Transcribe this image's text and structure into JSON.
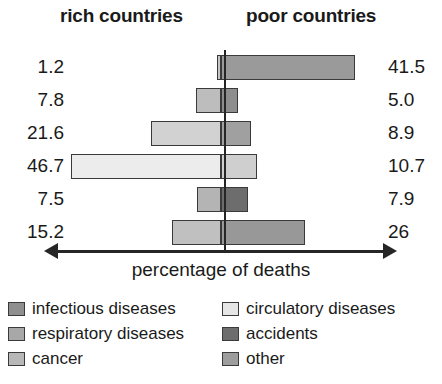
{
  "headings": {
    "left": "rich countries",
    "right": "poor countries"
  },
  "axis": {
    "caption": "percentage of deaths",
    "left_arrow_icon": "arrow-left-icon",
    "right_arrow_icon": "arrow-right-icon"
  },
  "legend": {
    "left_column": [
      {
        "label": "infectious diseases",
        "color": "#8f8f8f"
      },
      {
        "label": "respiratory diseases",
        "color": "#a8a8a8"
      },
      {
        "label": "cancer",
        "color": "#b8b8b8"
      }
    ],
    "right_column": [
      {
        "label": "circulatory diseases",
        "color": "#e6e6e6"
      },
      {
        "label": "accidents",
        "color": "#6d6d6d"
      },
      {
        "label": "other",
        "color": "#9d9d9d"
      }
    ]
  },
  "chart_data": {
    "type": "bar",
    "xlabel": "percentage of deaths",
    "ylabel": "",
    "orientation": "horizontal-diverging",
    "categories": [
      "infectious diseases",
      "respiratory diseases",
      "cancer",
      "circulatory diseases",
      "accidents",
      "other"
    ],
    "series": [
      {
        "name": "rich countries",
        "side": "left",
        "values": [
          1.2,
          7.8,
          21.6,
          46.7,
          7.5,
          15.2
        ],
        "labels": [
          "1.2",
          "7.8",
          "21.6",
          "46.7",
          "7.5",
          "15.2"
        ]
      },
      {
        "name": "poor countries",
        "side": "right",
        "values": [
          41.5,
          5.0,
          8.9,
          10.7,
          7.9,
          26
        ],
        "labels": [
          "41.5",
          "5.0",
          "8.9",
          "10.7",
          "7.9",
          "26"
        ]
      }
    ],
    "colors": [
      "#8f8f8f",
      "#a8a8a8",
      "#b8b8b8",
      "#e6e6e6",
      "#6d6d6d",
      "#9d9d9d"
    ],
    "grid": false,
    "legend_position": "bottom",
    "units": "percent"
  },
  "render": {
    "px_per_unit": 3.22,
    "rows": [
      {
        "category": "infectious diseases",
        "left_width": 4,
        "right_width": 134,
        "left_color": "#c6c6c6",
        "right_color": "#9a9a9a",
        "left_label": "1.2",
        "right_label": "41.5",
        "top": 0
      },
      {
        "category": "respiratory diseases",
        "left_width": 25,
        "right_width": 17,
        "left_color": "#bdbdbd",
        "right_color": "#8e8e8e",
        "left_label": "7.8",
        "right_label": "5.0",
        "top": 33
      },
      {
        "category": "cancer",
        "left_width": 70,
        "right_width": 30,
        "left_color": "#d2d2d2",
        "right_color": "#a0a0a0",
        "left_label": "21.6",
        "right_label": "8.9",
        "top": 66
      },
      {
        "category": "circulatory diseases",
        "left_width": 150,
        "right_width": 36,
        "left_color": "#ececec",
        "right_color": "#cfcfcf",
        "left_label": "46.7",
        "right_label": "10.7",
        "top": 99
      },
      {
        "category": "accidents",
        "left_width": 24,
        "right_width": 27,
        "left_color": "#b4b4b4",
        "right_color": "#6d6d6d",
        "left_label": "7.5",
        "right_label": "7.9",
        "top": 132
      },
      {
        "category": "other",
        "left_width": 49,
        "right_width": 84,
        "left_color": "#c0c0c0",
        "right_color": "#989898",
        "left_label": "15.2",
        "right_label": "26",
        "top": 165
      }
    ]
  }
}
